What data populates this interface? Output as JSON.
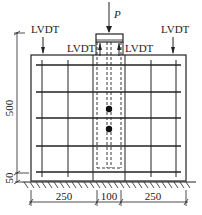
{
  "diagram": {
    "load_label": "P",
    "lvdt_labels": {
      "top_left": "LVDT",
      "top_right": "LVDT",
      "inner_left": "LVDT",
      "inner_right": "LVDT"
    },
    "dimensions": {
      "height_main": "500",
      "height_base": "50",
      "width_left": "250",
      "width_center": "100",
      "width_right": "250"
    },
    "colors": {
      "line": "#222222",
      "background": "#ffffff"
    }
  }
}
